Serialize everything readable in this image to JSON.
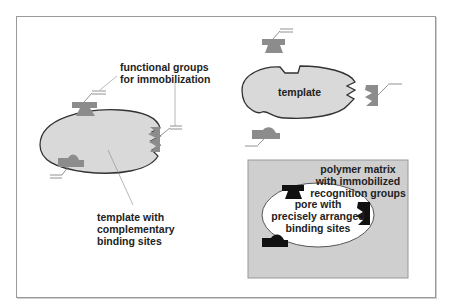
{
  "diagram": {
    "type": "molecular imprinting schematic",
    "labels": {
      "functional_groups": [
        "functional groups",
        "for immobilization"
      ],
      "template_with_sites": [
        "template with",
        "complementary",
        "binding sites"
      ],
      "template": "template",
      "polymer_matrix": [
        "polymer matrix",
        "with immobilized",
        "recognition groups"
      ],
      "pore": [
        "pore with",
        "precisely arranged",
        "binding sites"
      ]
    },
    "colors": {
      "template_fill": "#d9d9d9",
      "group_fill": "#8c8c8c",
      "matrix_fill": "#cfcfcf",
      "pore_fill": "#ffffff",
      "recognition_fill": "#111111",
      "outline": "#333333"
    }
  }
}
